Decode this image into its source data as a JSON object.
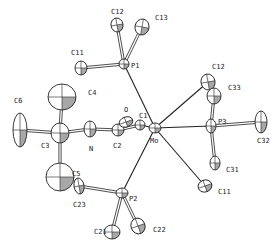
{
  "diagram": {
    "type": "ORTEP molecular structure",
    "atoms": [
      {
        "id": "Mo",
        "label": "Mo",
        "x": 155,
        "y": 128,
        "rx": 6,
        "ry": 5,
        "rot": 0,
        "lx": 150,
        "ly": 143
      },
      {
        "id": "P1",
        "label": "P1",
        "x": 124,
        "y": 64,
        "rx": 5,
        "ry": 5,
        "rot": 0,
        "lx": 131,
        "ly": 68
      },
      {
        "id": "P2",
        "label": "P2",
        "x": 122,
        "y": 193,
        "rx": 6,
        "ry": 5,
        "rot": 0,
        "lx": 129,
        "ly": 201
      },
      {
        "id": "P3",
        "label": "P3",
        "x": 211,
        "y": 126,
        "rx": 5,
        "ry": 7,
        "rot": 0,
        "lx": 218,
        "ly": 124
      },
      {
        "id": "C12a",
        "label": "C12",
        "x": 117,
        "y": 25,
        "rx": 6,
        "ry": 7,
        "rot": -10,
        "lx": 111,
        "ly": 14
      },
      {
        "id": "C13",
        "label": "C13",
        "x": 142,
        "y": 27,
        "rx": 7,
        "ry": 8,
        "rot": 10,
        "lx": 155,
        "ly": 20
      },
      {
        "id": "C11a",
        "label": "C11",
        "x": 81,
        "y": 68,
        "rx": 6,
        "ry": 7,
        "rot": 0,
        "lx": 71,
        "ly": 55
      },
      {
        "id": "C4",
        "label": "C4",
        "x": 62,
        "y": 97,
        "rx": 14,
        "ry": 13,
        "rot": 0,
        "lx": 88,
        "ly": 95
      },
      {
        "id": "C6",
        "label": "C6",
        "x": 20,
        "y": 130,
        "rx": 7,
        "ry": 17,
        "rot": 0,
        "lx": 14,
        "ly": 103
      },
      {
        "id": "C3",
        "label": "C3",
        "x": 60,
        "y": 133,
        "rx": 9,
        "ry": 10,
        "rot": 0,
        "lx": 41,
        "ly": 148
      },
      {
        "id": "N",
        "label": "N",
        "x": 90,
        "y": 129,
        "rx": 6,
        "ry": 8,
        "rot": 0,
        "lx": 89,
        "ly": 151
      },
      {
        "id": "C2",
        "label": "C2",
        "x": 118,
        "y": 130,
        "rx": 6,
        "ry": 6,
        "rot": 0,
        "lx": 113,
        "ly": 148
      },
      {
        "id": "O",
        "label": "O",
        "x": 126,
        "y": 122,
        "rx": 7,
        "ry": 5,
        "rot": -20,
        "lx": 124,
        "ly": 112
      },
      {
        "id": "C1",
        "label": "C1",
        "x": 140,
        "y": 125,
        "rx": 5,
        "ry": 5,
        "rot": 0,
        "lx": 139,
        "ly": 118
      },
      {
        "id": "C5",
        "label": "C5",
        "x": 60,
        "y": 177,
        "rx": 14,
        "ry": 14,
        "rot": 0,
        "lx": 72,
        "ly": 176
      },
      {
        "id": "C23",
        "label": "C23",
        "x": 79,
        "y": 186,
        "rx": 5,
        "ry": 8,
        "rot": -10,
        "lx": 73,
        "ly": 207
      },
      {
        "id": "C21",
        "label": "C21",
        "x": 112,
        "y": 232,
        "rx": 8,
        "ry": 7,
        "rot": 0,
        "lx": 94,
        "ly": 234
      },
      {
        "id": "C22",
        "label": "C22",
        "x": 138,
        "y": 226,
        "rx": 7,
        "ry": 8,
        "rot": -20,
        "lx": 153,
        "ly": 232
      },
      {
        "id": "C12b",
        "label": "C12",
        "x": 208,
        "y": 82,
        "rx": 7,
        "ry": 8,
        "rot": -10,
        "lx": 212,
        "ly": 69
      },
      {
        "id": "C33",
        "label": "C33",
        "x": 214,
        "y": 96,
        "rx": 7,
        "ry": 8,
        "rot": 0,
        "lx": 228,
        "ly": 90
      },
      {
        "id": "C31",
        "label": "C31",
        "x": 215,
        "y": 163,
        "rx": 5,
        "ry": 7,
        "rot": 0,
        "lx": 226,
        "ly": 172
      },
      {
        "id": "C11b",
        "label": "C11",
        "x": 205,
        "y": 186,
        "rx": 7,
        "ry": 6,
        "rot": -20,
        "lx": 218,
        "ly": 194
      },
      {
        "id": "C32",
        "label": "C32",
        "x": 261,
        "y": 122,
        "rx": 6,
        "ry": 11,
        "rot": 0,
        "lx": 257,
        "ly": 143
      }
    ],
    "bonds": [
      {
        "from": "Mo",
        "to": "P1",
        "style": "single"
      },
      {
        "from": "Mo",
        "to": "P2",
        "style": "single"
      },
      {
        "from": "Mo",
        "to": "P3",
        "style": "single"
      },
      {
        "from": "Mo",
        "to": "C12b",
        "style": "single"
      },
      {
        "from": "Mo",
        "to": "C11b",
        "style": "single"
      },
      {
        "from": "Mo",
        "to": "C1",
        "style": "single"
      },
      {
        "from": "P1",
        "to": "C12a",
        "style": "double"
      },
      {
        "from": "P1",
        "to": "C13",
        "style": "double"
      },
      {
        "from": "P1",
        "to": "C11a",
        "style": "double"
      },
      {
        "from": "P2",
        "to": "C23",
        "style": "double"
      },
      {
        "from": "P2",
        "to": "C21",
        "style": "double"
      },
      {
        "from": "P2",
        "to": "C22",
        "style": "double"
      },
      {
        "from": "P3",
        "to": "C33",
        "style": "double"
      },
      {
        "from": "P3",
        "to": "C31",
        "style": "double"
      },
      {
        "from": "P3",
        "to": "C32",
        "style": "double"
      },
      {
        "from": "C3",
        "to": "C4",
        "style": "double"
      },
      {
        "from": "C3",
        "to": "C5",
        "style": "double"
      },
      {
        "from": "C3",
        "to": "C6",
        "style": "double"
      },
      {
        "from": "C3",
        "to": "N",
        "style": "double"
      },
      {
        "from": "N",
        "to": "C2",
        "style": "double"
      },
      {
        "from": "C2",
        "to": "C1",
        "style": "double"
      },
      {
        "from": "C2",
        "to": "O",
        "style": "double"
      }
    ]
  }
}
